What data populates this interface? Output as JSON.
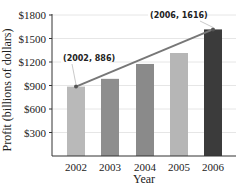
{
  "chart_data": {
    "type": "bar",
    "title": "",
    "xlabel": "Year",
    "ylabel": "Profit (billions of dollars)",
    "categories": [
      "2002",
      "2003",
      "2004",
      "2005",
      "2006"
    ],
    "values": [
      886,
      985,
      1175,
      1315,
      1616
    ],
    "bar_colors": [
      "#b9b9b9",
      "#8e8e8e",
      "#8a8a8a",
      "#b6b6b6",
      "#3b3b3b"
    ],
    "ylim": [
      0,
      1800
    ],
    "yticks": [
      300,
      600,
      900,
      1200,
      1500,
      1800
    ],
    "ytick_labels": [
      "$300",
      "$600",
      "$900",
      "$1200",
      "$1500",
      "$1800"
    ],
    "grid": true,
    "legend": null,
    "overlay_line": {
      "from": {
        "x": "2002",
        "y": 886
      },
      "to": {
        "x": "2006",
        "y": 1616
      },
      "color": "#777777"
    },
    "annotations": [
      {
        "text": "(2002, 886)",
        "x": "2002",
        "y": 886
      },
      {
        "text": "(2006, 1616)",
        "x": "2006",
        "y": 1616
      }
    ]
  }
}
